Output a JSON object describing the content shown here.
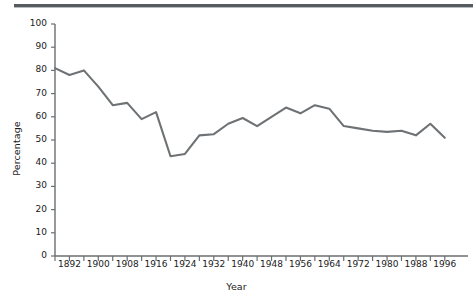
{
  "figure": {
    "clipped_header_text": "",
    "axis_color": "#6b6f71",
    "line_color": "#6e7274",
    "text_color": "#1a1a1a",
    "background": "#ffffff"
  },
  "chart_data": {
    "type": "line",
    "title": "",
    "subtitle": "",
    "xlabel": "Year",
    "ylabel": "Percentage",
    "xlim": [
      1888,
      1998
    ],
    "ylim": [
      0,
      100
    ],
    "grid": false,
    "legend": null,
    "y_ticks": [
      0,
      10,
      20,
      30,
      40,
      50,
      60,
      70,
      80,
      90,
      100
    ],
    "y_tick_labels": [
      "0",
      "10",
      "20",
      "30",
      "40",
      "50",
      "60",
      "70",
      "80",
      "90",
      "100"
    ],
    "x_ticks": [
      1888,
      1892,
      1896,
      1900,
      1904,
      1908,
      1912,
      1916,
      1920,
      1924,
      1928,
      1932,
      1936,
      1940,
      1944,
      1948,
      1952,
      1956,
      1960,
      1964,
      1968,
      1972,
      1976,
      1980,
      1984,
      1988,
      1992,
      1996
    ],
    "x_tick_labels": [
      "1892",
      "1900",
      "1908",
      "1916",
      "1924",
      "1932",
      "1940",
      "1948",
      "1956",
      "1964",
      "1972",
      "1980",
      "1988",
      "1996"
    ],
    "x_tick_label_values": [
      1892,
      1900,
      1908,
      1916,
      1924,
      1932,
      1940,
      1948,
      1956,
      1964,
      1972,
      1980,
      1988,
      1996
    ],
    "x": [
      1888,
      1892,
      1896,
      1900,
      1904,
      1908,
      1912,
      1916,
      1920,
      1924,
      1928,
      1932,
      1936,
      1940,
      1944,
      1948,
      1952,
      1956,
      1960,
      1964,
      1968,
      1972,
      1976,
      1980,
      1984,
      1988,
      1992,
      1996
    ],
    "values": [
      81,
      78,
      80,
      73,
      65,
      66,
      59,
      62,
      43,
      44,
      52,
      52.5,
      57,
      59.5,
      56,
      60,
      64,
      61.5,
      65,
      63.5,
      56,
      55,
      54,
      53.5,
      54,
      52,
      57,
      51
    ],
    "series": [
      {
        "name": "Percentage",
        "color": "#6e7274",
        "values": [
          81,
          78,
          80,
          73,
          65,
          66,
          59,
          62,
          43,
          44,
          52,
          52.5,
          57,
          59.5,
          56,
          60,
          64,
          61.5,
          65,
          63.5,
          56,
          55,
          54,
          53.5,
          54,
          52,
          57,
          51
        ]
      }
    ],
    "annotations": []
  }
}
